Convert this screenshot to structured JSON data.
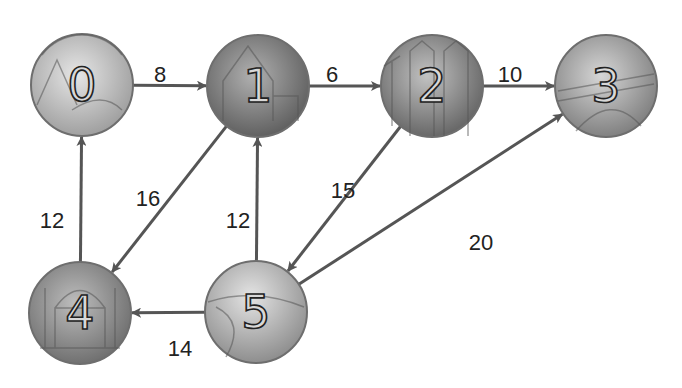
{
  "diagram": {
    "title": "",
    "type": "weighted-directed-graph",
    "nodes": [
      {
        "id": "0",
        "label": "0",
        "x": 82,
        "y": 85,
        "theme": "mountains-rainbow",
        "fill": "#b9b9b9"
      },
      {
        "id": "1",
        "label": "1",
        "x": 258,
        "y": 86,
        "theme": "mansion",
        "fill": "#8a8a8a"
      },
      {
        "id": "2",
        "label": "2",
        "x": 432,
        "y": 86,
        "theme": "cathedral-windmills",
        "fill": "#8c8c8c"
      },
      {
        "id": "3",
        "label": "3",
        "x": 606,
        "y": 86,
        "theme": "bridge",
        "fill": "#a3a3a3"
      },
      {
        "id": "4",
        "label": "4",
        "x": 80,
        "y": 313,
        "theme": "palace",
        "fill": "#8e8e8e"
      },
      {
        "id": "5",
        "label": "5",
        "x": 256,
        "y": 312,
        "theme": "beach",
        "fill": "#b0b0b0"
      }
    ],
    "edges": [
      {
        "from": "0",
        "to": "1",
        "weight": "8",
        "label_x": 160,
        "label_y": 74
      },
      {
        "from": "1",
        "to": "2",
        "weight": "6",
        "label_x": 332,
        "label_y": 74
      },
      {
        "from": "2",
        "to": "3",
        "weight": "10",
        "label_x": 510,
        "label_y": 74
      },
      {
        "from": "1",
        "to": "4",
        "weight": "16",
        "label_x": 148,
        "label_y": 198
      },
      {
        "from": "4",
        "to": "0",
        "weight": "12",
        "label_x": 52,
        "label_y": 220
      },
      {
        "from": "5",
        "to": "1",
        "weight": "12",
        "label_x": 238,
        "label_y": 220
      },
      {
        "from": "2",
        "to": "5",
        "weight": "15",
        "label_x": 343,
        "label_y": 190
      },
      {
        "from": "5",
        "to": "3",
        "weight": "20",
        "label_x": 481,
        "label_y": 242
      },
      {
        "from": "5",
        "to": "4",
        "weight": "14",
        "label_x": 180,
        "label_y": 348
      }
    ],
    "colors": {
      "edge": "#555555",
      "label": "#222222",
      "node_border": "#6e6e6e"
    }
  }
}
